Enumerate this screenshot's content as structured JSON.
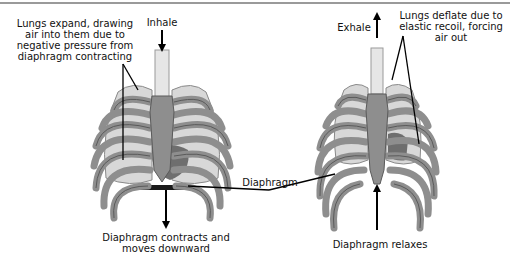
{
  "diagram": {
    "inhale": {
      "breath_label": "Inhale",
      "lung_caption_lines": [
        "Lungs expand, drawing",
        "air into them due to",
        "negative pressure from",
        "diaphragm contracting"
      ],
      "diaphragm_caption_lines": [
        "Diaphragm contracts and",
        "moves downward"
      ]
    },
    "exhale": {
      "breath_label": "Exhale",
      "lung_caption_lines": [
        "Lungs deflate due to",
        "elastic recoil, forcing",
        "air out"
      ],
      "diaphragm_caption": "Diaphragm relaxes"
    },
    "shared_label": "Diaphragm",
    "colors": {
      "bone": "#8e8e8e",
      "bone_outline": "#5a5a5a",
      "lung": "#d8d8d8",
      "trachea": "#e6e6e6",
      "diaphragm": "#1a1a1a",
      "heart": "#6e6e6e",
      "arrow": "#000000",
      "border": "#9a9a9a"
    }
  }
}
